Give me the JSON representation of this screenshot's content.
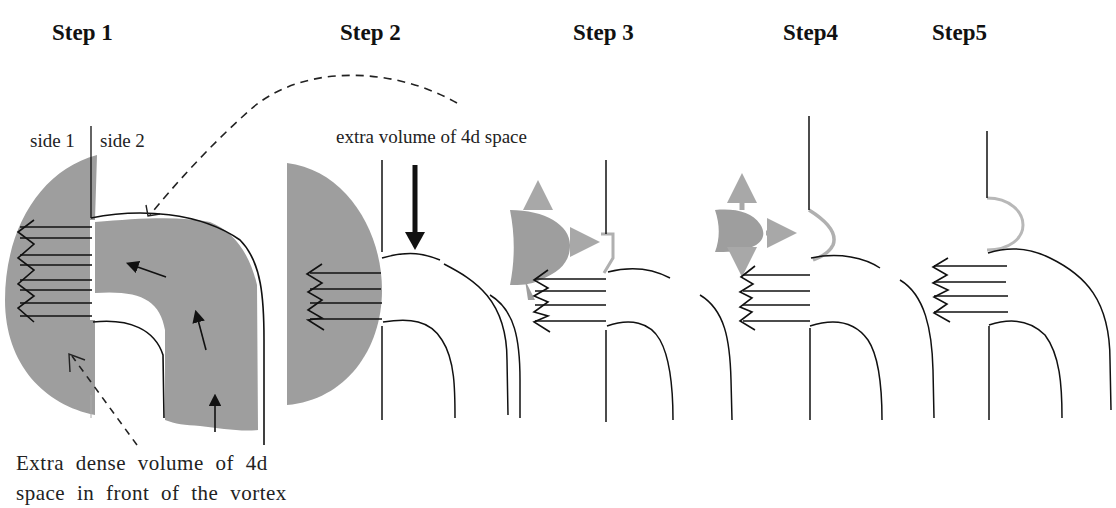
{
  "steps": [
    {
      "title": "Step 1"
    },
    {
      "title": "Step 2"
    },
    {
      "title": "Step 3"
    },
    {
      "title": "Step4"
    },
    {
      "title": "Step5"
    }
  ],
  "labels": {
    "side1": "side 1",
    "side2": "side 2",
    "extra_volume": "extra volume of 4d space",
    "caption_line1": "Extra dense volume of 4d",
    "caption_line2": "space in front of the vortex"
  },
  "colors": {
    "shaded_region": "#9e9e9e",
    "light_gray_stroke": "#b0b0b0",
    "line": "#111111"
  }
}
